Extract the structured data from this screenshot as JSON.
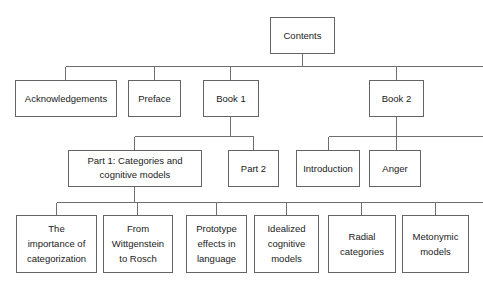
{
  "diagram": {
    "type": "tree",
    "title": "Contents",
    "background_color": "#ffffff",
    "box_stroke_color": "#646464",
    "connector_color": "#6e6e6e",
    "text_color": "#1a1a1a",
    "nodes": {
      "root": {
        "label": "Contents"
      },
      "level1": [
        {
          "id": "acknowledgements",
          "label": "Acknowledgements"
        },
        {
          "id": "preface",
          "label": "Preface"
        },
        {
          "id": "book1",
          "label": "Book 1"
        },
        {
          "id": "book2",
          "label": "Book 2"
        }
      ],
      "level2": [
        {
          "id": "part1",
          "label": "Part 1: Categories and cognitive models",
          "line1": "Part 1: Categories and",
          "line2": "cognitive models",
          "parent": "book1"
        },
        {
          "id": "part2",
          "label": "Part 2",
          "line1": "Part 2",
          "parent": "book1"
        },
        {
          "id": "introduction",
          "label": "Introduction",
          "line1": "Introduction",
          "parent": "book2"
        },
        {
          "id": "anger",
          "label": "Anger",
          "line1": "Anger",
          "parent": "book2"
        }
      ],
      "level3": [
        {
          "id": "importance-of-categorization",
          "label": "The importance of categorization",
          "line1": "The",
          "line2": "importance of",
          "line3": "categorization",
          "parent": "part1"
        },
        {
          "id": "wittgenstein-to-rosch",
          "label": "From Wittgenstein to Rosch",
          "line1": "From",
          "line2": "Wittgenstein",
          "line3": "to Rosch",
          "parent": "part1"
        },
        {
          "id": "prototype-effects-in-language",
          "label": "Prototype effects in language",
          "line1": "Prototype",
          "line2": "effects in",
          "line3": "language",
          "parent": "part1"
        },
        {
          "id": "idealized-cognitive-models",
          "label": "Idealized cognitive models",
          "line1": "Idealized",
          "line2": "cognitive",
          "line3": "models",
          "parent": "part1"
        },
        {
          "id": "radial-categories",
          "label": "Radial categories",
          "line1": "Radial",
          "line2": "categories",
          "parent": "part1"
        },
        {
          "id": "metonymic-models",
          "label": "Metonymic models",
          "line1": "Metonymic",
          "line2": "models",
          "parent": "part1"
        }
      ]
    }
  }
}
